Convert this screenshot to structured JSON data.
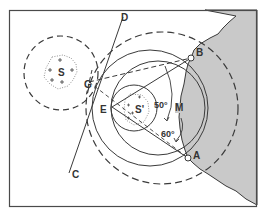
{
  "diagram": {
    "colors": {
      "line": "#3a3a3a",
      "land_fill": "#c8c8c8",
      "frame": "#4a4a4a",
      "background": "#ffffff"
    },
    "points": {
      "A": "A",
      "B": "B",
      "C": "C",
      "D": "D",
      "E": "E",
      "G": "G",
      "M": "M",
      "S": "S",
      "S_prime": "S'"
    },
    "angles": {
      "angle_1": "50°",
      "angle_2": "60°"
    },
    "elements": [
      "frame",
      "land-mass",
      "shoal-S",
      "shoal-S-prime",
      "danger-circle-S",
      "danger-circle-through-A-B",
      "inner-circle-S-prime",
      "line-CD",
      "bearing-lines"
    ]
  }
}
